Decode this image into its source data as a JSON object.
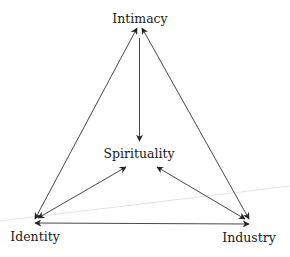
{
  "diagram": {
    "type": "relationship-triangle",
    "nodes": [
      {
        "id": "intimacy",
        "label": "Intimacy",
        "position": "top"
      },
      {
        "id": "spirituality",
        "label": "Spirituality",
        "position": "center"
      },
      {
        "id": "identity",
        "label": "Identity",
        "position": "bottom-left"
      },
      {
        "id": "industry",
        "label": "Industry",
        "position": "bottom-right"
      }
    ],
    "edges": [
      {
        "from": "identity",
        "to": "intimacy",
        "direction": "bidirectional"
      },
      {
        "from": "industry",
        "to": "intimacy",
        "direction": "bidirectional"
      },
      {
        "from": "intimacy",
        "to": "spirituality",
        "direction": "one-way"
      },
      {
        "from": "identity",
        "to": "spirituality",
        "direction": "bidirectional"
      },
      {
        "from": "industry",
        "to": "spirituality",
        "direction": "bidirectional"
      },
      {
        "from": "identity",
        "to": "industry",
        "direction": "bidirectional"
      }
    ],
    "colors": {
      "arrow": "#333333",
      "text": "#222222",
      "background": "#ffffff",
      "faint_line": "#e6e6e6"
    }
  }
}
